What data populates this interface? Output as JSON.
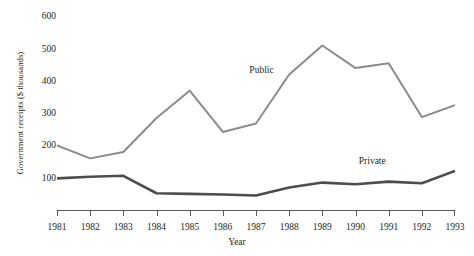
{
  "chart_data": {
    "type": "line",
    "title": "",
    "xlabel": "Year",
    "ylabel": "Government receipts ($ thousands)",
    "categories": [
      "1981",
      "1982",
      "1983",
      "1984",
      "1985",
      "1986",
      "1987",
      "1988",
      "1989",
      "1990",
      "1991",
      "1992",
      "1993"
    ],
    "x": [
      1981,
      1982,
      1983,
      1984,
      1985,
      1986,
      1987,
      1988,
      1989,
      1990,
      1991,
      1992,
      1993
    ],
    "xlim": [
      1981,
      1993
    ],
    "ylim": [
      0,
      620
    ],
    "yticks": [
      100,
      200,
      300,
      400,
      500,
      600
    ],
    "ytick_labels": [
      "100",
      "200",
      "300",
      "400",
      "500",
      "600"
    ],
    "grid": false,
    "legend_position": "inline-annotation",
    "series": [
      {
        "name": "Public",
        "color": "#8b8b8b",
        "line_width": 2,
        "values": [
          200,
          160,
          180,
          285,
          370,
          242,
          268,
          420,
          510,
          440,
          455,
          288,
          325
        ],
        "annotation": {
          "text": "Public",
          "x": 1986.8,
          "y": 430
        }
      },
      {
        "name": "Private",
        "color": "#4d4d4d",
        "line_width": 2.6,
        "values": [
          98,
          103,
          106,
          52,
          50,
          48,
          45,
          70,
          85,
          80,
          88,
          83,
          121
        ],
        "annotation": {
          "text": "Private",
          "x": 1990.1,
          "y": 150
        }
      }
    ]
  }
}
